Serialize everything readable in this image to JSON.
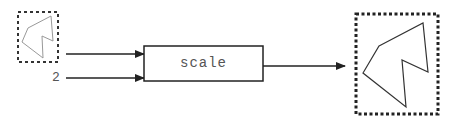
{
  "diagram": {
    "function_box": {
      "label": "scale"
    },
    "inputs": [
      {
        "kind": "image",
        "description": "small polygon shape"
      },
      {
        "kind": "number",
        "value": "2"
      }
    ],
    "output": {
      "kind": "image",
      "description": "scaled polygon shape (2x)"
    },
    "colors": {
      "stroke": "#222222",
      "shape": "#888888",
      "text": "#555555"
    }
  }
}
